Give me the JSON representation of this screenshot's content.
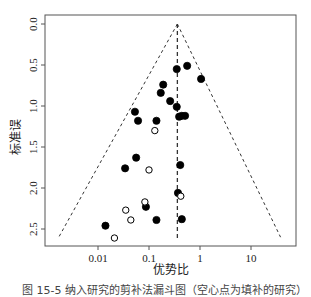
{
  "chart_data": {
    "type": "scatter",
    "subtype": "funnel-plot",
    "title": "",
    "xlabel": "优势比",
    "ylabel": "标准误",
    "x_scale": "log",
    "xlim": [
      0.0011,
      70
    ],
    "ylim": [
      2.72,
      0.0
    ],
    "y_inverted": true,
    "x_ticks": [
      0.01,
      0.1,
      1,
      10
    ],
    "x_tick_labels": [
      "0.01",
      "0.1",
      "1",
      "10"
    ],
    "y_ticks": [
      0.0,
      0.5,
      1.0,
      1.5,
      2.0,
      2.5
    ],
    "y_tick_labels": [
      "0.0",
      "0.5",
      "1.0",
      "1.5",
      "2.0",
      "2.5"
    ],
    "grid": false,
    "legend": null,
    "center_line_or": 0.36,
    "funnel": {
      "apex": {
        "or": 0.36,
        "se": 0.0
      },
      "bottom_left": {
        "or": 0.0017,
        "se": 2.6
      },
      "bottom_right": {
        "or": 38,
        "se": 2.6
      },
      "line_style": "dashed"
    },
    "series": [
      {
        "name": "observed studies",
        "marker": "filled-circle",
        "color": "#000000",
        "points": [
          {
            "or": 0.35,
            "se": 0.55
          },
          {
            "or": 0.56,
            "se": 0.51
          },
          {
            "or": 1.05,
            "se": 0.67
          },
          {
            "or": 0.19,
            "se": 0.74
          },
          {
            "or": 0.17,
            "se": 0.84
          },
          {
            "or": 0.26,
            "se": 0.94
          },
          {
            "or": 0.35,
            "se": 1.01
          },
          {
            "or": 0.053,
            "se": 1.07
          },
          {
            "or": 0.061,
            "se": 1.18
          },
          {
            "or": 0.14,
            "se": 1.18
          },
          {
            "or": 0.39,
            "se": 1.13
          },
          {
            "or": 0.44,
            "se": 1.12
          },
          {
            "or": 0.51,
            "se": 1.12
          },
          {
            "or": 0.056,
            "se": 1.63
          },
          {
            "or": 0.034,
            "se": 1.76
          },
          {
            "or": 0.41,
            "se": 1.72
          },
          {
            "or": 0.37,
            "se": 2.06
          },
          {
            "or": 0.087,
            "se": 2.23
          },
          {
            "or": 0.14,
            "se": 2.39
          },
          {
            "or": 0.44,
            "se": 2.38
          },
          {
            "or": 0.014,
            "se": 2.46
          }
        ]
      },
      {
        "name": "imputed studies (trim and fill)",
        "marker": "open-circle",
        "color": "#000000",
        "points": [
          {
            "or": 0.13,
            "se": 1.3
          },
          {
            "or": 0.1,
            "se": 1.78
          },
          {
            "or": 0.42,
            "se": 2.1
          },
          {
            "or": 0.083,
            "se": 2.17
          },
          {
            "or": 0.035,
            "se": 2.27
          },
          {
            "or": 0.044,
            "se": 2.39
          },
          {
            "or": 0.021,
            "se": 2.61
          }
        ]
      }
    ]
  },
  "caption": "图 15-5  纳入研究的剪补法漏斗图（空心点为填补的研究）"
}
